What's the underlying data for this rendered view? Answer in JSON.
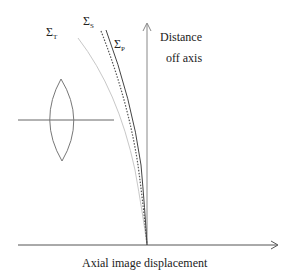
{
  "diagram": {
    "axes": {
      "vertical_label_line1": "Distance",
      "vertical_label_line2": "off axis",
      "horizontal_label": "Axial image displacement"
    },
    "surfaces": [
      {
        "id": "T",
        "symbol": "Σ",
        "subscript": "T",
        "style": "light solid",
        "color": "#c8c8c8"
      },
      {
        "id": "S",
        "symbol": "Σ",
        "subscript": "S",
        "style": "dotted",
        "color": "#555555"
      },
      {
        "id": "P",
        "symbol": "Σ",
        "subscript": "P",
        "style": "solid",
        "color": "#444444"
      }
    ],
    "lens": {
      "type": "biconvex",
      "color": "#666666"
    }
  }
}
